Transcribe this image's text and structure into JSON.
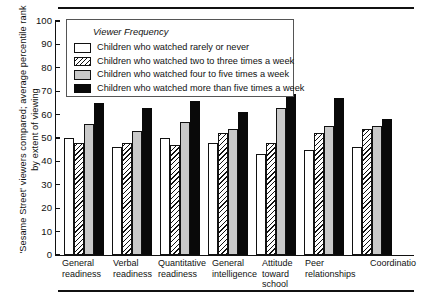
{
  "chart_data": {
    "type": "bar",
    "title": "",
    "xlabel": "",
    "ylabel": "'Sesame Street' viewers compared; average percentile rank by extent of viewing",
    "ylim": [
      0,
      100
    ],
    "yticks": [
      0,
      10,
      20,
      30,
      40,
      50,
      60,
      70,
      80,
      90,
      100
    ],
    "grid": false,
    "legend_position": "upper-left-inside",
    "legend_title": "Viewer Frequency",
    "categories": [
      "General\nreadiness",
      "Verbal\nreadiness",
      "Quantitative\nreadiness",
      "General\nintelligence",
      "Attitude\ntoward\nschool",
      "Peer\nrelationships",
      "Coordinatio"
    ],
    "series": [
      {
        "name": "Children who watched rarely or never",
        "fill": "white",
        "values": [
          50,
          46,
          50,
          48,
          43,
          45,
          46
        ]
      },
      {
        "name": "Children who watched two to three times a week",
        "fill": "hatched",
        "values": [
          48,
          48,
          47,
          52,
          48,
          52,
          54
        ]
      },
      {
        "name": "Children who watched four to five times a week",
        "fill": "gray",
        "values": [
          56,
          53,
          57,
          54,
          63,
          55,
          55
        ]
      },
      {
        "name": "Children who watched more than five times a week",
        "fill": "black",
        "values": [
          65,
          63,
          66,
          61,
          69,
          67,
          58
        ]
      }
    ],
    "colors": {
      "series_white": "#ffffff",
      "series_hatched": "#ffffff",
      "series_gray": "#c9c9c9",
      "series_black": "#090909",
      "axis": "#111111",
      "background": "#ffffff"
    }
  }
}
